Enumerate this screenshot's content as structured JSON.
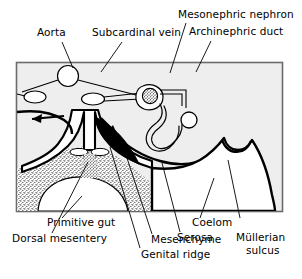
{
  "figure": {
    "type": "anatomical-diagram",
    "frame": {
      "x": 16,
      "y": 62,
      "width": 267,
      "height": 150,
      "border_color": "#555555",
      "fill_color": "#eeeeee"
    },
    "colors": {
      "outline": "#000000",
      "fill_light": "#f2f2f2",
      "fill_white": "#ffffff",
      "mesenchyme_stipple": "#111111",
      "genital_ridge_dark": "#000000",
      "label_text": "#000000",
      "leader_line": "#333333",
      "frame_border": "#666666"
    },
    "labels": [
      {
        "id": "aorta",
        "text": "Aorta",
        "x": 37,
        "y": 32,
        "leader_from": [
          64,
          44
        ],
        "leader_to": [
          73,
          68
        ]
      },
      {
        "id": "subcardinal-vein",
        "text": "Subcardinal vein",
        "x": 94,
        "y": 32,
        "leader_from": [
          122,
          44
        ],
        "leader_to": [
          100,
          70
        ]
      },
      {
        "id": "mesonephric-nephron",
        "text": "Mesonephric nephron",
        "x": 178,
        "y": 13,
        "leader_from": [
          188,
          25
        ],
        "leader_to": [
          172,
          70
        ]
      },
      {
        "id": "archinephric-duct",
        "text": "Archinephric duct",
        "x": 189,
        "y": 31,
        "leader_from": [
          212,
          43
        ],
        "leader_to": [
          196,
          70
        ]
      },
      {
        "id": "primitive-gut",
        "text": "Primitive gut",
        "x": 48,
        "y": 222,
        "leader_from": [
          64,
          220
        ],
        "leader_to": [
          82,
          196
        ]
      },
      {
        "id": "dorsal-mesentery",
        "text": "Dorsal mesentery",
        "x": 13,
        "y": 238,
        "leader_from": [
          60,
          235
        ],
        "leader_to": [
          88,
          150
        ]
      },
      {
        "id": "genital-ridge",
        "text": "Genital ridge",
        "x": 142,
        "y": 254,
        "leader_from": [
          140,
          250
        ],
        "leader_to": [
          112,
          148
        ]
      },
      {
        "id": "mesenchyme",
        "text": "Mesenchyme",
        "x": 152,
        "y": 240,
        "leader_from": [
          151,
          236
        ],
        "leader_to": [
          124,
          150
        ]
      },
      {
        "id": "serosa",
        "text": "Serosa",
        "x": 178,
        "y": 238,
        "leader_from": [
          180,
          234
        ],
        "leader_to": [
          160,
          160
        ]
      },
      {
        "id": "coelom",
        "text": "Coelom",
        "x": 193,
        "y": 222,
        "leader_from": [
          200,
          220
        ],
        "leader_to": [
          212,
          176
        ]
      },
      {
        "id": "mullerian-sulcus-line1",
        "text": "Müllerian",
        "x": 237,
        "y": 222,
        "leader_from": [
          240,
          220
        ],
        "leader_to": [
          227,
          164
        ]
      },
      {
        "id": "mullerian-sulcus-line2",
        "text": "sulcus",
        "x": 246,
        "y": 236
      }
    ],
    "structures": [
      {
        "id": "aorta-vessel",
        "label": "Aorta",
        "shape": "circle",
        "cx": 68,
        "cy": 76,
        "r": 10
      },
      {
        "id": "subcardinal-vein-vessel",
        "label": "Subcardinal vein",
        "shape": "ellipse",
        "cx": 93,
        "cy": 98,
        "rx": 11,
        "ry": 6
      },
      {
        "id": "left-vessel",
        "label": "Subcardinal vein (left)",
        "shape": "ellipse",
        "cx": 35,
        "cy": 97,
        "rx": 11,
        "ry": 6
      },
      {
        "id": "glomerulus",
        "label": "Glomerulus",
        "shape": "stippled-circle",
        "cx": 150,
        "cy": 95,
        "r": 8
      },
      {
        "id": "mesonephric-tubule",
        "label": "Mesonephric nephron tubule",
        "shape": "convoluted-tube"
      },
      {
        "id": "archinephric-duct-lumen",
        "label": "Archinephric duct",
        "shape": "circle",
        "cx": 188,
        "cy": 122,
        "r": 7
      },
      {
        "id": "primitive-gut-lumen",
        "label": "Primitive gut",
        "shape": "dome",
        "cx": 84,
        "cy": 205
      },
      {
        "id": "mesenchyme-region",
        "label": "Mesenchyme",
        "shape": "stippled-region"
      },
      {
        "id": "genital-ridge-region",
        "label": "Genital ridge",
        "shape": "dark-wedge"
      },
      {
        "id": "coelom-region",
        "label": "Coelom",
        "shape": "open-cavity"
      },
      {
        "id": "mullerian-sulcus-notch",
        "label": "Müllerian sulcus",
        "shape": "notch",
        "x": 222,
        "y": 160
      }
    ],
    "flow_arrows": [
      {
        "id": "left-coelom-arrow",
        "direction": "left",
        "x": 30,
        "y": 118
      },
      {
        "id": "right-genital-arrow",
        "direction": "down-right",
        "x": 112,
        "y": 130
      }
    ]
  }
}
